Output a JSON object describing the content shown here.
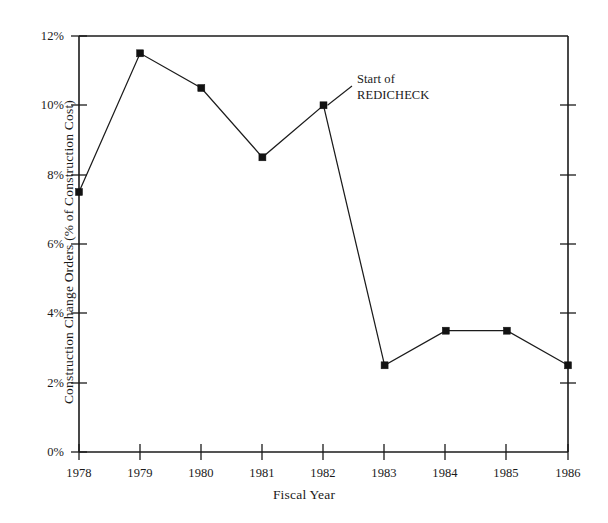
{
  "chart_data": {
    "type": "line",
    "title": "",
    "xlabel": "Fiscal Year",
    "ylabel": "Construction Change Orders (% of Construction Cost)",
    "categories": [
      "1978",
      "1979",
      "1980",
      "1981",
      "1982",
      "1983",
      "1984",
      "1985",
      "1986"
    ],
    "values": [
      7.5,
      11.5,
      10.5,
      8.5,
      10.0,
      2.5,
      3.5,
      3.5,
      2.5
    ],
    "series": [
      {
        "name": "Construction Change Orders",
        "values": [
          7.5,
          11.5,
          10.5,
          8.5,
          10.0,
          2.5,
          3.5,
          3.5,
          2.5
        ]
      }
    ],
    "xlim": [
      1978,
      1986
    ],
    "ylim": [
      0,
      12
    ],
    "ytick_labels": [
      "0%",
      "2%",
      "4%",
      "6%",
      "8%",
      "10%",
      "12%"
    ],
    "ytick_values": [
      0,
      2,
      4,
      6,
      8,
      10,
      12
    ],
    "xtick_labels": [
      "1978",
      "1979",
      "1980",
      "1981",
      "1982",
      "1983",
      "1984",
      "1985",
      "1986"
    ],
    "grid": false,
    "legend": false,
    "marker": "square",
    "line_color": "#1b1b1b",
    "marker_color": "#121212",
    "annotations": [
      {
        "text_line1": "Start of",
        "text_line2": "REDICHECK",
        "points_to_category": "1982",
        "points_to_value": 10.0
      }
    ]
  }
}
